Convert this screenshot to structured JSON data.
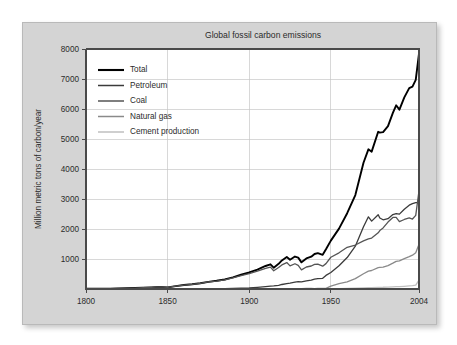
{
  "figure": {
    "panel_background": "#d4d4d4",
    "plot_background": "#ffffff",
    "gridline_color": "#c8c8c8",
    "axis_color": "#4a4a4a"
  },
  "chart_data": {
    "type": "line",
    "title": "Global fossil carbon emissions",
    "xlabel": "",
    "ylabel": "Million metric tons of carbon/year",
    "xlim": [
      1800,
      2004
    ],
    "ylim": [
      0,
      8000
    ],
    "xticks": [
      1800,
      1850,
      1900,
      1950,
      2004
    ],
    "xtick_labels": [
      "1800",
      "1850",
      "1900",
      "1950",
      "2004"
    ],
    "yticks": [
      1000,
      2000,
      3000,
      4000,
      5000,
      6000,
      7000,
      8000
    ],
    "ytick_labels": [
      "1000",
      "2000",
      "3000",
      "4000",
      "5000",
      "6000",
      "7000",
      "8000"
    ],
    "grid": true,
    "legend_position": "upper left",
    "x": [
      1800,
      1805,
      1810,
      1815,
      1820,
      1825,
      1830,
      1835,
      1840,
      1845,
      1850,
      1855,
      1860,
      1865,
      1870,
      1875,
      1880,
      1885,
      1890,
      1895,
      1900,
      1905,
      1910,
      1913,
      1915,
      1918,
      1920,
      1923,
      1925,
      1928,
      1930,
      1932,
      1935,
      1938,
      1940,
      1942,
      1945,
      1947,
      1950,
      1955,
      1960,
      1965,
      1970,
      1973,
      1975,
      1979,
      1980,
      1982,
      1985,
      1988,
      1990,
      1992,
      1995,
      1998,
      2000,
      2002,
      2004
    ],
    "series": [
      {
        "name": "Total",
        "color": "#000000",
        "linewidth": 1.9,
        "values": [
          8,
          9,
          10,
          12,
          17,
          24,
          32,
          42,
          54,
          70,
          54,
          96,
          132,
          159,
          188,
          236,
          276,
          320,
          396,
          474,
          534,
          640,
          770,
          843,
          730,
          828,
          932,
          1057,
          975,
          1104,
          1053,
          877,
          1017,
          1078,
          1175,
          1204,
          1116,
          1310,
          1630,
          2043,
          2577,
          3095,
          4076,
          4617,
          4614,
          5382,
          5322,
          5136,
          5319,
          5826,
          6143,
          6113,
          6402,
          6611,
          6751,
          6971,
          7910
        ]
      },
      {
        "name": "Petroleum",
        "color": "#3b3b3b",
        "linewidth": 1.3,
        "values": [
          0,
          0,
          0,
          0,
          0,
          0,
          0,
          0,
          0,
          0,
          0,
          0,
          1,
          2,
          3,
          5,
          8,
          12,
          19,
          28,
          35,
          55,
          80,
          97,
          105,
          122,
          147,
          179,
          196,
          231,
          248,
          235,
          272,
          296,
          334,
          351,
          349,
          449,
          558,
          784,
          1070,
          1410,
          2012,
          2386,
          2280,
          2542,
          2416,
          2265,
          2297,
          2461,
          2521,
          2551,
          2667,
          2760,
          2847,
          2880,
          2900
        ]
      },
      {
        "name": "Coal",
        "color": "#555555",
        "linewidth": 1.3,
        "values": [
          8,
          9,
          10,
          12,
          17,
          24,
          32,
          42,
          54,
          70,
          54,
          96,
          131,
          157,
          185,
          231,
          268,
          308,
          377,
          446,
          499,
          585,
          690,
          746,
          625,
          706,
          785,
          872,
          771,
          860,
          793,
          630,
          733,
          766,
          826,
          835,
          747,
          838,
          1070,
          1224,
          1419,
          1450,
          1556,
          1656,
          1713,
          1923,
          1991,
          1998,
          2186,
          2367,
          2397,
          2297,
          2322,
          2338,
          2334,
          2454,
          3300
        ]
      },
      {
        "name": "Natural gas",
        "color": "#8a8a8a",
        "linewidth": 1.3,
        "values": [
          0,
          0,
          0,
          0,
          0,
          0,
          0,
          0,
          0,
          0,
          0,
          0,
          0,
          0,
          0,
          0,
          0,
          0,
          0,
          0,
          0,
          0,
          0,
          0,
          0,
          0,
          0,
          5,
          8,
          13,
          12,
          12,
          16,
          16,
          15,
          18,
          20,
          23,
          97,
          180,
          243,
          340,
          493,
          590,
          622,
          734,
          739,
          713,
          762,
          855,
          925,
          956,
          1013,
          1063,
          1128,
          1210,
          1500
        ]
      },
      {
        "name": "Cement production",
        "color": "#bfbfbf",
        "linewidth": 1.3,
        "values": [
          0,
          0,
          0,
          0,
          0,
          0,
          0,
          0,
          0,
          0,
          0,
          0,
          0,
          0,
          0,
          0,
          0,
          0,
          0,
          0,
          0,
          0,
          0,
          0,
          0,
          0,
          0,
          1,
          2,
          3,
          3,
          2,
          3,
          4,
          4,
          3,
          3,
          5,
          7,
          13,
          18,
          26,
          35,
          43,
          45,
          55,
          57,
          58,
          63,
          73,
          77,
          80,
          90,
          100,
          110,
          126,
          298
        ]
      }
    ]
  },
  "legend": {
    "items": [
      {
        "label": "Total",
        "color": "#000000"
      },
      {
        "label": "Petroleum",
        "color": "#3b3b3b"
      },
      {
        "label": "Coal",
        "color": "#555555"
      },
      {
        "label": "Natural gas",
        "color": "#8a8a8a"
      },
      {
        "label": "Cement production",
        "color": "#bfbfbf"
      }
    ]
  }
}
